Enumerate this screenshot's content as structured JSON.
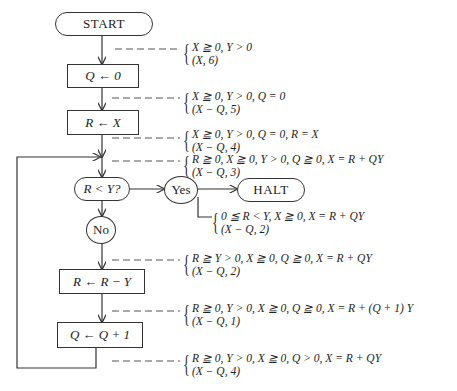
{
  "nodes": {
    "start": "START",
    "init_q": "Q ← 0",
    "init_r": "R ← X",
    "test": "R < Y?",
    "yes": "Yes",
    "no": "No",
    "halt": "HALT",
    "sub": "R ← R − Y",
    "inc": "Q ← Q + 1"
  },
  "annotations": [
    {
      "condition": "X ≧ 0, Y > 0",
      "label": "(X, 6)"
    },
    {
      "condition": "X ≧ 0, Y > 0, Q = 0",
      "label": "(X − Q, 5)"
    },
    {
      "condition": "X ≧ 0, Y > 0, Q = 0, R = X",
      "label": "(X − Q, 4)"
    },
    {
      "condition": "R ≧ 0, X ≧ 0, Y > 0, Q ≧ 0, X = R + QY",
      "label": "(X − Q, 3)"
    },
    {
      "condition": "0 ≦ R < Y, X ≧ 0, X = R + QY",
      "label": "(X − Q, 2)"
    },
    {
      "condition": "R ≧ Y > 0, X ≧ 0, Q ≧ 0, X = R + QY",
      "label": "(X − Q, 2)"
    },
    {
      "condition": "R ≧ 0, Y > 0, X ≧ 0, Q ≧ 0, X = R + (Q + 1) Y",
      "label": "(X − Q, 1)"
    },
    {
      "condition": "R ≧ 0, Y > 0, X ≧ 0, Q > 0, X = R + QY",
      "label": "(X − Q, 4)"
    }
  ]
}
